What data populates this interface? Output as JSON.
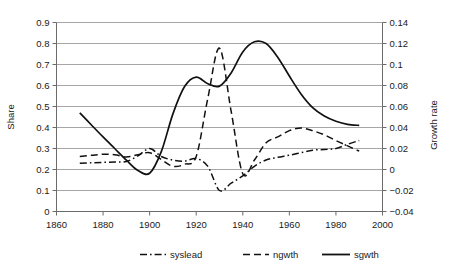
{
  "chart_data": {
    "type": "line",
    "title": "",
    "xlabel": "",
    "ylabel": "Share",
    "y2label": "Growth rate",
    "xlim": [
      1860,
      2000
    ],
    "ylim": [
      0,
      0.9
    ],
    "y2lim": [
      -0.04,
      0.14
    ],
    "xticks": [
      "1860",
      "1880",
      "1900",
      "1920",
      "1940",
      "1960",
      "1980",
      "2000"
    ],
    "xtick_values": [
      1860,
      1880,
      1900,
      1920,
      1940,
      1960,
      1980,
      2000
    ],
    "yticks": [
      "0",
      "0.1",
      "0.2",
      "0.3",
      "0.4",
      "0.5",
      "0.6",
      "0.7",
      "0.8",
      "0.9"
    ],
    "ytick_values": [
      0,
      0.1,
      0.2,
      0.3,
      0.4,
      0.5,
      0.6,
      0.7,
      0.8,
      0.9
    ],
    "y2ticks": [
      "-0.04",
      "-0.02",
      "0",
      "0.02",
      "0.04",
      "0.06",
      "0.08",
      "0.1",
      "0.12",
      "0.14"
    ],
    "y2tick_values": [
      -0.04,
      -0.02,
      0,
      0.02,
      0.04,
      0.06,
      0.08,
      0.1,
      0.12,
      0.14
    ],
    "grid": true,
    "legend_position": "bottom",
    "series": [
      {
        "name": "syslead",
        "axis": "left",
        "style": "dash-dot",
        "color": "#111111",
        "x": [
          1870,
          1875,
          1880,
          1885,
          1890,
          1895,
          1900,
          1905,
          1910,
          1915,
          1920,
          1925,
          1930,
          1935,
          1940,
          1945,
          1950,
          1955,
          1960,
          1965,
          1970,
          1975,
          1980,
          1985,
          1990
        ],
        "values": [
          0.23,
          0.232,
          0.234,
          0.236,
          0.238,
          0.265,
          0.3,
          0.262,
          0.245,
          0.24,
          0.252,
          0.215,
          0.1,
          0.135,
          0.17,
          0.215,
          0.245,
          0.258,
          0.268,
          0.28,
          0.292,
          0.295,
          0.3,
          0.32,
          0.338
        ]
      },
      {
        "name": "ngwth",
        "axis": "right",
        "style": "dashed",
        "color": "#111111",
        "x": [
          1870,
          1875,
          1880,
          1885,
          1890,
          1895,
          1900,
          1905,
          1910,
          1915,
          1920,
          1925,
          1930,
          1935,
          1940,
          1945,
          1950,
          1955,
          1960,
          1965,
          1970,
          1975,
          1980,
          1985,
          1990
        ],
        "values": [
          0.0125,
          0.0135,
          0.0145,
          0.014,
          0.012,
          0.014,
          0.016,
          0.0095,
          0.003,
          0.005,
          0.0125,
          0.068,
          0.1155,
          0.0555,
          -0.004,
          0.009,
          0.0255,
          0.031,
          0.037,
          0.0395,
          0.037,
          0.033,
          0.0275,
          0.0225,
          0.0175
        ]
      },
      {
        "name": "sgwth",
        "axis": "left",
        "style": "solid",
        "color": "#111111",
        "x": [
          1870,
          1875,
          1880,
          1885,
          1890,
          1895,
          1900,
          1905,
          1910,
          1915,
          1920,
          1925,
          1930,
          1935,
          1940,
          1945,
          1950,
          1955,
          1960,
          1965,
          1970,
          1975,
          1980,
          1985,
          1990
        ],
        "values": [
          0.47,
          0.412,
          0.355,
          0.3,
          0.245,
          0.195,
          0.182,
          0.285,
          0.465,
          0.595,
          0.64,
          0.608,
          0.597,
          0.66,
          0.76,
          0.808,
          0.8,
          0.735,
          0.645,
          0.56,
          0.495,
          0.455,
          0.43,
          0.415,
          0.41
        ]
      }
    ]
  },
  "legend": {
    "items": [
      {
        "label": "syslead",
        "style": "dash-dot"
      },
      {
        "label": "ngwth",
        "style": "dashed"
      },
      {
        "label": "sgwth",
        "style": "solid"
      }
    ]
  }
}
